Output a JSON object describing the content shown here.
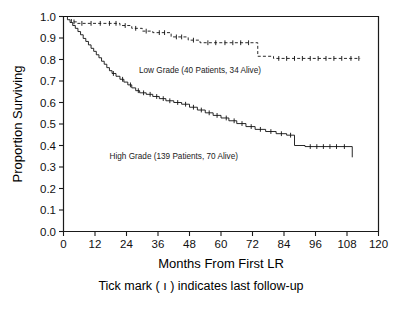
{
  "chart_data": {
    "type": "line",
    "title": "",
    "xlabel": "Months From First LR",
    "ylabel": "Proportion Surviving",
    "caption": "Tick mark ( ı ) indicates last follow-up",
    "xlim": [
      0,
      120
    ],
    "ylim": [
      0.0,
      1.0
    ],
    "xticks": [
      0,
      12,
      24,
      36,
      48,
      60,
      72,
      84,
      96,
      108,
      120
    ],
    "xtick_labels": [
      "0",
      "12",
      "24",
      "36",
      "48",
      "60",
      "72",
      "84",
      "96",
      "108",
      "120"
    ],
    "yticks": [
      0.0,
      0.1,
      0.2,
      0.3,
      0.4,
      0.5,
      0.6,
      0.7,
      0.8,
      0.9,
      1.0
    ],
    "ytick_labels": [
      "0.0",
      "0.1",
      "0.2",
      "0.3",
      "0.4",
      "0.5",
      "0.6",
      "0.7",
      "0.8",
      "0.9",
      "1.0"
    ],
    "grid": false,
    "legend_position": "inline-annotation",
    "series": [
      {
        "name": "Low Grade",
        "label": "Low Grade  (40 Patients,  34 Alive)",
        "patients": 40,
        "alive": 34,
        "style": "dashed",
        "color": "#111111",
        "label_x": 52,
        "label_y": 0.735,
        "steps": [
          [
            0,
            1.0
          ],
          [
            3.0,
            1.0
          ],
          [
            3.0,
            0.975
          ],
          [
            5.0,
            0.975
          ],
          [
            5.0,
            0.968
          ],
          [
            21.5,
            0.968
          ],
          [
            21.5,
            0.958
          ],
          [
            26.0,
            0.958
          ],
          [
            26.0,
            0.945
          ],
          [
            30.0,
            0.945
          ],
          [
            30.0,
            0.932
          ],
          [
            34.0,
            0.932
          ],
          [
            34.0,
            0.925
          ],
          [
            41.0,
            0.925
          ],
          [
            41.0,
            0.905
          ],
          [
            47.5,
            0.905
          ],
          [
            47.5,
            0.89
          ],
          [
            52.0,
            0.89
          ],
          [
            52.0,
            0.878
          ],
          [
            74.0,
            0.878
          ],
          [
            74.0,
            0.815
          ],
          [
            80.0,
            0.815
          ],
          [
            80.0,
            0.805
          ],
          [
            113.0,
            0.805
          ]
        ],
        "censor_x": [
          4.0,
          7.0,
          10.5,
          14.0,
          17.5,
          20.0,
          23.5,
          27.5,
          31.5,
          36.5,
          38.5,
          43.0,
          45.0,
          49.5,
          55.0,
          58.0,
          61.5,
          64.5,
          67.5,
          70.5,
          82.0,
          85.0,
          88.0,
          91.0,
          94.0,
          97.0,
          100.0,
          103.0,
          106.0,
          109.5,
          112.5
        ]
      },
      {
        "name": "High Grade",
        "label": "High Grade  (139 Patients, 70 Alive)",
        "patients": 139,
        "alive": 70,
        "style": "solid",
        "color": "#111111",
        "label_x": 42,
        "label_y": 0.335,
        "steps": [
          [
            0,
            1.0
          ],
          [
            1.5,
            1.0
          ],
          [
            1.5,
            0.985
          ],
          [
            2.5,
            0.985
          ],
          [
            2.5,
            0.972
          ],
          [
            3.5,
            0.972
          ],
          [
            3.5,
            0.958
          ],
          [
            4.5,
            0.958
          ],
          [
            4.5,
            0.945
          ],
          [
            5.5,
            0.945
          ],
          [
            5.5,
            0.93
          ],
          [
            6.5,
            0.93
          ],
          [
            6.5,
            0.915
          ],
          [
            7.5,
            0.915
          ],
          [
            7.5,
            0.898
          ],
          [
            8.5,
            0.898
          ],
          [
            8.5,
            0.884
          ],
          [
            9.5,
            0.884
          ],
          [
            9.5,
            0.868
          ],
          [
            10.5,
            0.868
          ],
          [
            10.5,
            0.852
          ],
          [
            11.5,
            0.852
          ],
          [
            11.5,
            0.838
          ],
          [
            12.5,
            0.838
          ],
          [
            12.5,
            0.822
          ],
          [
            13.5,
            0.822
          ],
          [
            13.5,
            0.808
          ],
          [
            14.5,
            0.808
          ],
          [
            14.5,
            0.792
          ],
          [
            15.5,
            0.792
          ],
          [
            15.5,
            0.778
          ],
          [
            16.5,
            0.778
          ],
          [
            16.5,
            0.762
          ],
          [
            17.5,
            0.762
          ],
          [
            17.5,
            0.748
          ],
          [
            18.5,
            0.748
          ],
          [
            18.5,
            0.735
          ],
          [
            20.0,
            0.735
          ],
          [
            20.0,
            0.722
          ],
          [
            21.5,
            0.722
          ],
          [
            21.5,
            0.708
          ],
          [
            23.0,
            0.708
          ],
          [
            23.0,
            0.695
          ],
          [
            24.5,
            0.695
          ],
          [
            24.5,
            0.682
          ],
          [
            26.0,
            0.682
          ],
          [
            26.0,
            0.668
          ],
          [
            27.5,
            0.668
          ],
          [
            27.5,
            0.655
          ],
          [
            29.0,
            0.655
          ],
          [
            29.0,
            0.645
          ],
          [
            31.5,
            0.645
          ],
          [
            31.5,
            0.638
          ],
          [
            34.0,
            0.638
          ],
          [
            34.0,
            0.628
          ],
          [
            36.5,
            0.628
          ],
          [
            36.5,
            0.618
          ],
          [
            39.0,
            0.618
          ],
          [
            39.0,
            0.608
          ],
          [
            42.0,
            0.608
          ],
          [
            42.0,
            0.6
          ],
          [
            45.0,
            0.6
          ],
          [
            45.0,
            0.592
          ],
          [
            48.0,
            0.592
          ],
          [
            48.0,
            0.578
          ],
          [
            51.0,
            0.578
          ],
          [
            51.0,
            0.565
          ],
          [
            54.0,
            0.565
          ],
          [
            54.0,
            0.552
          ],
          [
            57.0,
            0.552
          ],
          [
            57.0,
            0.54
          ],
          [
            60.0,
            0.54
          ],
          [
            60.0,
            0.528
          ],
          [
            63.0,
            0.528
          ],
          [
            63.0,
            0.515
          ],
          [
            66.0,
            0.515
          ],
          [
            66.0,
            0.502
          ],
          [
            69.5,
            0.502
          ],
          [
            69.5,
            0.488
          ],
          [
            73.0,
            0.488
          ],
          [
            73.0,
            0.475
          ],
          [
            77.0,
            0.475
          ],
          [
            77.0,
            0.465
          ],
          [
            81.0,
            0.465
          ],
          [
            81.0,
            0.455
          ],
          [
            85.0,
            0.455
          ],
          [
            85.0,
            0.448
          ],
          [
            88.0,
            0.448
          ],
          [
            88.0,
            0.4
          ],
          [
            92.0,
            0.4
          ],
          [
            92.0,
            0.395
          ],
          [
            110.0,
            0.395
          ],
          [
            110.0,
            0.345
          ]
        ],
        "censor_x": [
          19.0,
          22.5,
          25.5,
          28.5,
          30.5,
          33.0,
          35.5,
          38.0,
          40.5,
          43.5,
          46.5,
          49.5,
          52.5,
          55.5,
          58.5,
          62.0,
          65.0,
          68.0,
          71.5,
          75.0,
          79.0,
          83.0,
          86.5,
          94.0,
          96.5,
          99.0,
          101.5,
          104.0,
          107.0
        ]
      }
    ]
  },
  "figure": {
    "background_color": "#ffffff",
    "axis_color": "#1a1a1a",
    "curve_color": "#111111"
  }
}
